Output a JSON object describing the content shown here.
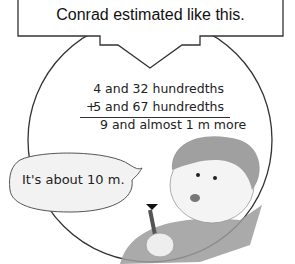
{
  "header": {
    "title": "Conrad estimated like this."
  },
  "calculation": {
    "line1": "4 and 32 hundredths",
    "operator": "+",
    "line2": "5 and 67 hundredths",
    "result": "9 and almost 1 m more"
  },
  "speech_bubble": {
    "text": "It's about 10 m."
  },
  "colors": {
    "stroke": "#333333",
    "box_fill": "#ffffff",
    "bubble_fill": "#f2f2f2",
    "hair": "#9a9a9a",
    "sweater": "#8a8a8a"
  }
}
